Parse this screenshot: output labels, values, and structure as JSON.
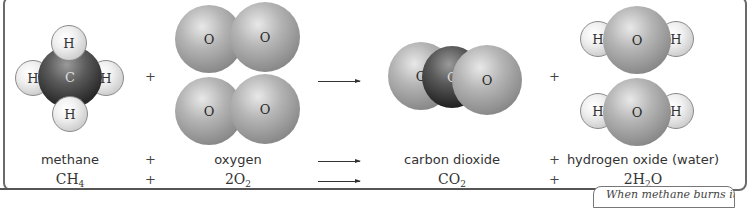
{
  "diagram": {
    "molecules": {
      "methane": {
        "atoms": [
          "H",
          "H",
          "C",
          "H",
          "H"
        ]
      },
      "oxygen_1": {
        "atoms": [
          "O",
          "O"
        ]
      },
      "oxygen_2": {
        "atoms": [
          "O",
          "O"
        ]
      },
      "carbon_dioxide": {
        "atoms": [
          "O",
          "C",
          "O"
        ]
      },
      "water_1": {
        "atoms": [
          "H",
          "O",
          "H"
        ]
      },
      "water_2": {
        "atoms": [
          "H",
          "O",
          "H"
        ]
      }
    },
    "operators": {
      "plus": "+"
    },
    "names": {
      "reactant_1": "methane",
      "reactant_2": "oxygen",
      "product_1": "carbon dioxide",
      "product_2": "hydrogen oxide (water)"
    },
    "formulas": {
      "reactant_1": {
        "base": "CH",
        "sub": "4",
        "tail": ""
      },
      "reactant_2": {
        "base": "2O",
        "sub": "2",
        "tail": ""
      },
      "product_1": {
        "base": "CO",
        "sub": "2",
        "tail": ""
      },
      "product_2": {
        "base": "2H",
        "sub": "2",
        "tail": "O"
      }
    },
    "caption_fragment": "When methane burns it joins"
  }
}
